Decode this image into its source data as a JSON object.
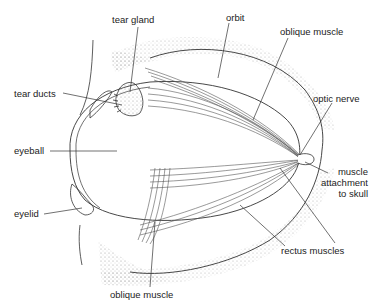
{
  "diagram": {
    "labels": {
      "tear_gland": "tear gland",
      "orbit": "orbit",
      "oblique_muscle_top": "oblique muscle",
      "tear_ducts": "tear ducts",
      "optic_nerve": "optic nerve",
      "eyeball": "eyeball",
      "muscle_attachment_1": "muscle",
      "muscle_attachment_2": "attachment",
      "muscle_attachment_3": "to skull",
      "eyelid": "eyelid",
      "rectus_muscles": "rectus muscles",
      "oblique_muscle_bottom": "oblique muscle"
    },
    "colors": {
      "line": "#333333",
      "stipple": "#bdbdbd",
      "background": "#ffffff"
    }
  }
}
